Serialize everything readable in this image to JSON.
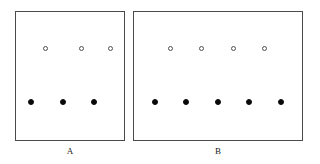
{
  "figure": {
    "background_color": "#ffffff",
    "border_color": "#4a4a4a",
    "filled_marker_color": "#0a0a0a",
    "open_marker_color": "#ffffff",
    "open_marker_edge_color": "#4f4f4f",
    "label_color": "#1a1a1a"
  },
  "chart_data": {
    "type": "scatter",
    "title": "",
    "xlabel": "",
    "ylabel": "",
    "grid": false,
    "legend": null,
    "panels": [
      {
        "label": "A",
        "label_x": 70,
        "label_y": 146,
        "frame": {
          "x": 15,
          "y": 11,
          "width": 110,
          "height": 130
        },
        "series": [
          {
            "name": "open circles",
            "marker": "open-circle",
            "count": 3,
            "points": [
              {
                "x": 44.5,
                "y": 47.5
              },
              {
                "x": 80.0,
                "y": 47.5
              },
              {
                "x": 109.0,
                "y": 47.5
              }
            ]
          },
          {
            "name": "filled circles",
            "marker": "filled-circle",
            "count": 3,
            "points": [
              {
                "x": 30.0,
                "y": 100.5
              },
              {
                "x": 62.0,
                "y": 100.5
              },
              {
                "x": 92.5,
                "y": 100.5
              }
            ]
          }
        ]
      },
      {
        "label": "B",
        "label_x": 218,
        "label_y": 146,
        "frame": {
          "x": 133,
          "y": 11,
          "width": 170,
          "height": 130
        },
        "series": [
          {
            "name": "open circles",
            "marker": "open-circle",
            "count": 4,
            "points": [
              {
                "x": 169.0,
                "y": 47.5
              },
              {
                "x": 200.5,
                "y": 47.5
              },
              {
                "x": 232.5,
                "y": 47.5
              },
              {
                "x": 263.5,
                "y": 47.5
              }
            ]
          },
          {
            "name": "filled circles",
            "marker": "filled-circle",
            "count": 5,
            "points": [
              {
                "x": 154.0,
                "y": 100.5
              },
              {
                "x": 185.0,
                "y": 100.5
              },
              {
                "x": 216.5,
                "y": 100.5
              },
              {
                "x": 248.0,
                "y": 100.5
              },
              {
                "x": 279.5,
                "y": 100.5
              }
            ]
          }
        ]
      }
    ]
  }
}
